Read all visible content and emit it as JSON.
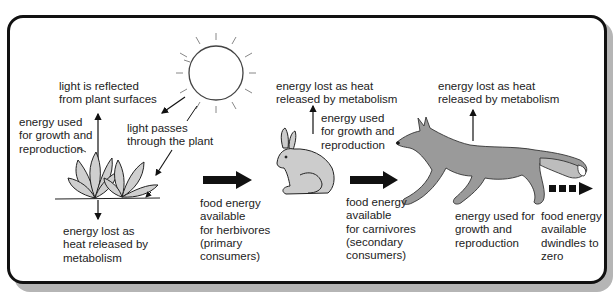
{
  "diagram": {
    "stages": [
      {
        "name": "sun",
        "icon": "sun-icon"
      },
      {
        "name": "plant",
        "icon": "plant-icon"
      },
      {
        "name": "herbivore",
        "icon": "rabbit-icon"
      },
      {
        "name": "carnivore",
        "icon": "fox-icon"
      }
    ],
    "labels": {
      "light_reflected": "light is reflected\nfrom plant surfaces",
      "light_passes": "light passes\nthrough the plant",
      "plant_growth": "energy used\nfor growth and\nreproduction",
      "plant_heat": "energy lost as\nheat released by\nmetabolism",
      "food_herbivores": "food energy\navailable\nfor herbivores\n(primary\nconsumers)",
      "rabbit_heat": "energy lost as heat\nreleased by metabolism",
      "rabbit_growth": "energy used\nfor growth and\nreproduction",
      "food_carnivores": "food energy\navailable\nfor carnivores\n(secondary\nconsumers)",
      "fox_heat": "energy lost as heat\nreleased by metabolism",
      "fox_growth": "energy used for\ngrowth and\nreproduction",
      "food_dwindles": "food energy\navailable\ndwindles to\nzero"
    },
    "colors": {
      "frame": "#111111",
      "shadow": "#b5b5b5",
      "animal_fill": "#9a9a9a",
      "plant_fill": "#c8c8c8",
      "arrow": "#111111"
    }
  }
}
